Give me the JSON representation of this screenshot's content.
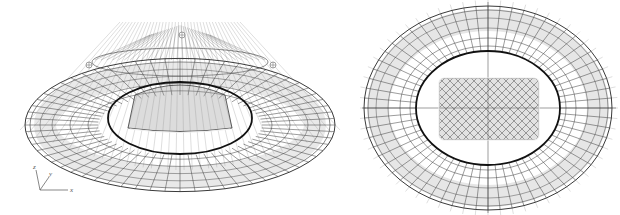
{
  "figure": {
    "panels": [
      {
        "id": "perspective",
        "label": "3D perspective view of stadium roof wireframe model"
      },
      {
        "id": "plan",
        "label": "Plan (top) view of stadium roof wireframe model"
      }
    ],
    "axes": {
      "x": "x",
      "y": "y",
      "z": "z"
    },
    "caption": "",
    "colors": {
      "background": "#ffffff",
      "mesh": "#3a3a3a",
      "mesh_light": "#9a9a9a",
      "cables": "#c8c8c8",
      "ring": "#111111"
    },
    "structure": {
      "outer_ring_count": 2,
      "inner_compression_ring": true,
      "radial_members": 64,
      "central_opening": "rounded-rectangle"
    }
  }
}
